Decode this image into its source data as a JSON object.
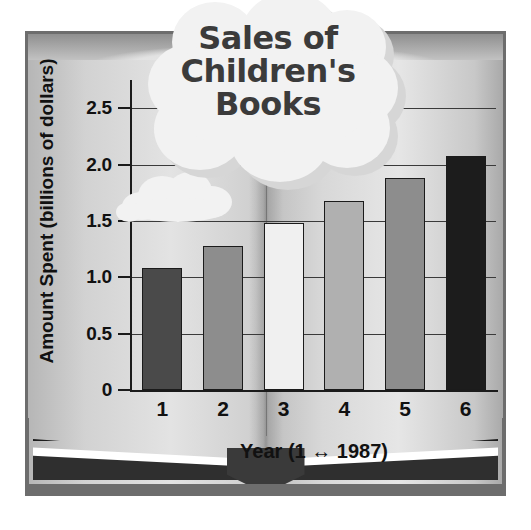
{
  "chart_data": {
    "type": "bar",
    "title": "Sales of Children's Books",
    "title_lines": [
      "Sales of",
      "Children's",
      "Books"
    ],
    "xlabel": "Year (1 ↔ 1987)",
    "ylabel": "Amount Spent (billions of dollars)",
    "categories": [
      "1",
      "2",
      "3",
      "4",
      "5",
      "6"
    ],
    "values": [
      1.08,
      1.28,
      1.48,
      1.68,
      1.88,
      2.08
    ],
    "ylim": [
      0,
      2.75
    ],
    "yticks": [
      "0",
      "0.5",
      "1.0",
      "1.5",
      "2.0",
      "2.5"
    ],
    "ytick_values": [
      0,
      0.5,
      1.0,
      1.5,
      2.0,
      2.5
    ],
    "grid": true,
    "legend": "none",
    "bar_colors": [
      "#4a4a4a",
      "#8d8d8d",
      "#f0f0f0",
      "#b0b0b0",
      "#8d8d8d",
      "#1c1c1c"
    ],
    "bar_outline_color": "#1b1b1b"
  },
  "colors": {
    "frame": "#6d6d6d",
    "page": "#d4d4d4",
    "ink": "#111111",
    "cloud": "#f2f2f2",
    "cloud_shadow": "#d6d6d6",
    "title_text": "#3b3b3b"
  },
  "decor": {
    "book_label": "open-book-illustration",
    "title_cloud_label": "thought-cloud",
    "small_cloud_label": "small-cloud"
  }
}
